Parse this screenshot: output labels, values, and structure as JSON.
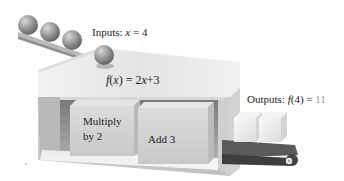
{
  "diagram": {
    "inputs": {
      "prefix": "Inputs: ",
      "variable": "x",
      "equals": " = ",
      "value": "4"
    },
    "function": {
      "name": "f",
      "open": "(",
      "variable": "x",
      "close": ")",
      "rhs_prefix": " = 2",
      "rhs_var": "x",
      "rhs_suffix": "+3"
    },
    "steps": [
      {
        "line1": "Multiply",
        "line2": "by 2"
      },
      {
        "line1": "Add 3"
      }
    ],
    "outputs": {
      "prefix": "Outputs: ",
      "name": "f",
      "arg": "(4)",
      "equals": " = ",
      "value": "11"
    },
    "input_ball_count": 4,
    "output_cube_count": 2,
    "colors": {
      "ball": "#8a8a8a",
      "box_top": "#e6e6e6",
      "box_side": "#c9c9c9",
      "inner_block": "#d2d2d2",
      "belt": "#555555",
      "output_text_value": "#9a9a9a"
    }
  }
}
